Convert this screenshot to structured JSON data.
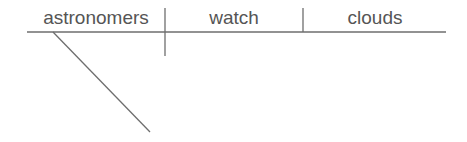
{
  "diagram": {
    "type": "sentence-diagram",
    "sentence_parts": {
      "subject": "astronomers",
      "verb": "watch",
      "direct_object": "clouds"
    },
    "colors": {
      "line": "#6e6e6e",
      "text": "#555555",
      "background": "#ffffff"
    }
  }
}
